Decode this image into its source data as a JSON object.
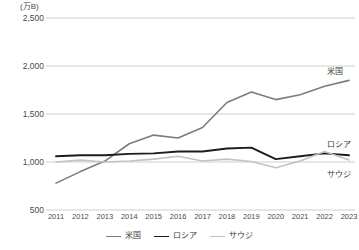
{
  "chart_data": {
    "type": "line",
    "title": "",
    "unit_label": "(万B)",
    "xlabel": "",
    "ylabel": "",
    "categories": [
      "2011",
      "2012",
      "2013",
      "2014",
      "2015",
      "2016",
      "2017",
      "2018",
      "2019",
      "2020",
      "2021",
      "2022",
      "2023"
    ],
    "ylim": [
      500,
      2500
    ],
    "yticks": [
      "500",
      "1,000",
      "1,500",
      "2,000",
      "2,500"
    ],
    "ytick_values": [
      500,
      1000,
      1500,
      2000,
      2500
    ],
    "grid": true,
    "legend_position": "bottom",
    "series": [
      {
        "name": "米国",
        "color": "#7c7c7c",
        "width": 1.6,
        "values": [
          780,
          900,
          1010,
          1190,
          1280,
          1250,
          1360,
          1620,
          1730,
          1650,
          1700,
          1790,
          1850
        ]
      },
      {
        "name": "ロシア",
        "color": "#1c1c1c",
        "width": 1.9,
        "values": [
          1060,
          1070,
          1070,
          1085,
          1090,
          1110,
          1110,
          1140,
          1150,
          1030,
          1060,
          1090,
          1070
        ]
      },
      {
        "name": "サウジ",
        "color": "#c2c2c2",
        "width": 1.6,
        "values": [
          1000,
          1020,
          1000,
          1010,
          1030,
          1060,
          1010,
          1030,
          1005,
          940,
          1010,
          1110,
          1020
        ]
      }
    ],
    "annotations": [
      {
        "text": "米国",
        "x": 2022.1,
        "y": 1955
      },
      {
        "text": "ロシア",
        "x": 2022.1,
        "y": 1195
      },
      {
        "text": "サウジ",
        "x": 2022.1,
        "y": 885
      }
    ]
  }
}
